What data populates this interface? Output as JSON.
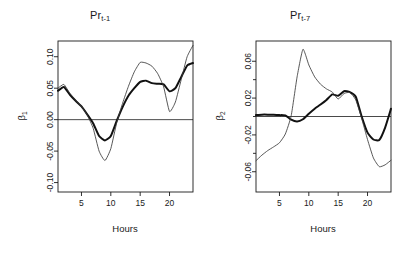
{
  "figure": {
    "width": 401,
    "height": 253,
    "background": "#ffffff",
    "panel_count": 2
  },
  "chart_data": [
    {
      "type": "line",
      "panel": "left",
      "title": "Pr",
      "title_subscript": "t-1",
      "xlabel": "Hours",
      "ylabel": "β",
      "ylabel_subscript": "1",
      "xlim": [
        1,
        24
      ],
      "ylim": [
        -0.115,
        0.125
      ],
      "xticks": [
        5,
        10,
        15,
        20
      ],
      "xtick_labels": [
        "5",
        "10",
        "15",
        "20"
      ],
      "yticks": [
        -0.1,
        -0.05,
        0.0,
        0.05,
        0.1
      ],
      "ytick_labels": [
        "-0.10",
        "-0.05",
        "0.00",
        "0.05",
        "0.10"
      ],
      "grid": false,
      "legend": "none",
      "zero_reference_line": 0.0,
      "x": [
        1,
        2,
        3,
        4,
        5,
        6,
        7,
        8,
        9,
        10,
        11,
        12,
        13,
        14,
        15,
        16,
        17,
        18,
        19,
        20,
        21,
        22,
        23,
        24
      ],
      "series": [
        {
          "name": "thick-curve",
          "style": "thick",
          "color": "#111111",
          "values": [
            0.046,
            0.052,
            0.04,
            0.03,
            0.021,
            0.008,
            -0.006,
            -0.026,
            -0.033,
            -0.026,
            -0.002,
            0.02,
            0.038,
            0.05,
            0.06,
            0.062,
            0.058,
            0.057,
            0.056,
            0.045,
            0.05,
            0.068,
            0.086,
            0.09
          ]
        },
        {
          "name": "thin-curve",
          "style": "thin",
          "color": "#3a3a3a",
          "values": [
            0.05,
            0.056,
            0.042,
            0.031,
            0.021,
            0.007,
            -0.014,
            -0.05,
            -0.065,
            -0.046,
            -0.005,
            0.026,
            0.053,
            0.076,
            0.091,
            0.09,
            0.085,
            0.073,
            0.052,
            0.013,
            0.028,
            0.064,
            0.1,
            0.118
          ]
        }
      ]
    },
    {
      "type": "line",
      "panel": "right",
      "title": "Pr",
      "title_subscript": "t-7",
      "xlabel": "Hours",
      "ylabel": "β",
      "ylabel_subscript": "2",
      "xlim": [
        1,
        24
      ],
      "ylim": [
        -0.082,
        0.082
      ],
      "xticks": [
        5,
        10,
        15,
        20
      ],
      "xtick_labels": [
        "5",
        "10",
        "15",
        "20"
      ],
      "yticks": [
        -0.06,
        -0.02,
        0.02,
        0.06
      ],
      "ytick_labels": [
        "-0.06",
        "-0.02",
        "0.02",
        "0.06"
      ],
      "minor_yticks": [
        -0.04,
        0.0,
        0.04
      ],
      "grid": false,
      "legend": "none",
      "zero_reference_line": 0.0,
      "x": [
        1,
        2,
        3,
        4,
        5,
        6,
        7,
        8,
        9,
        10,
        11,
        12,
        13,
        14,
        15,
        16,
        17,
        18,
        19,
        20,
        21,
        22,
        23,
        24
      ],
      "series": [
        {
          "name": "thick-curve",
          "style": "thick",
          "color": "#111111",
          "values": [
            0.0015,
            0.002,
            0.002,
            0.0018,
            0.0015,
            0.0012,
            -0.0035,
            -0.0055,
            -0.003,
            0.003,
            0.0085,
            0.013,
            0.018,
            0.024,
            0.0225,
            0.0275,
            0.0265,
            0.0215,
            0.0,
            -0.0175,
            -0.025,
            -0.0255,
            -0.012,
            0.0085
          ]
        },
        {
          "name": "thin-curve",
          "style": "thin",
          "color": "#3a3a3a",
          "values": [
            -0.048,
            -0.042,
            -0.037,
            -0.033,
            -0.0285,
            -0.019,
            0.001,
            0.043,
            0.073,
            0.056,
            0.043,
            0.035,
            0.03,
            0.0265,
            0.019,
            0.025,
            0.026,
            0.018,
            -0.002,
            -0.025,
            -0.045,
            -0.0545,
            -0.0525,
            -0.0475
          ]
        }
      ]
    }
  ]
}
